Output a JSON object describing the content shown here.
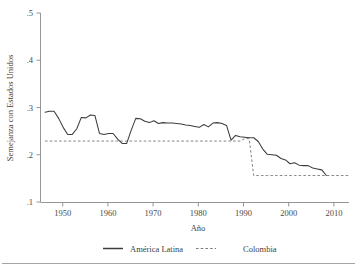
{
  "chart_data": {
    "type": "line",
    "title": "",
    "xlabel": "Año",
    "ylabel": "Semejanza con Estados Unidos",
    "xlim": [
      1945,
      2013
    ],
    "ylim": [
      0.1,
      0.5
    ],
    "grid": false,
    "legend_position": "bottom",
    "xticks": [
      "1950",
      "1960",
      "1970",
      "1980",
      "1990",
      "2000",
      "2010"
    ],
    "xtick_values": [
      1950,
      1960,
      1970,
      1980,
      1990,
      2000,
      2010
    ],
    "yticks": [
      ".1",
      ".2",
      ".3",
      ".4",
      ".5"
    ],
    "ytick_values": [
      0.1,
      0.2,
      0.3,
      0.4,
      0.5
    ],
    "x": [
      1946,
      1947,
      1948,
      1949,
      1950,
      1951,
      1952,
      1953,
      1954,
      1955,
      1956,
      1957,
      1958,
      1959,
      1960,
      1961,
      1962,
      1963,
      1964,
      1965,
      1966,
      1967,
      1968,
      1969,
      1970,
      1971,
      1972,
      1973,
      1974,
      1975,
      1976,
      1977,
      1978,
      1979,
      1980,
      1981,
      1982,
      1983,
      1984,
      1985,
      1986,
      1987,
      1988,
      1989,
      1990,
      1991,
      1992,
      1993,
      1994,
      1995,
      1996,
      1997,
      1998,
      1999,
      2000,
      2001,
      2002,
      2003,
      2004,
      2005,
      2006,
      2007,
      2008
    ],
    "series": [
      {
        "name": "América Latina",
        "style": "solid",
        "color": "#3c3c3c",
        "values": [
          0.29,
          0.292,
          0.292,
          0.277,
          0.258,
          0.243,
          0.243,
          0.255,
          0.279,
          0.278,
          0.284,
          0.283,
          0.245,
          0.243,
          0.245,
          0.245,
          0.233,
          0.224,
          0.224,
          0.252,
          0.277,
          0.276,
          0.271,
          0.268,
          0.272,
          0.266,
          0.268,
          0.267,
          0.267,
          0.266,
          0.265,
          0.263,
          0.262,
          0.26,
          0.258,
          0.264,
          0.259,
          0.267,
          0.268,
          0.266,
          0.262,
          0.231,
          0.241,
          0.238,
          0.237,
          0.236,
          0.236,
          0.228,
          0.212,
          0.201,
          0.2,
          0.199,
          0.192,
          0.189,
          0.181,
          0.183,
          0.178,
          0.177,
          0.177,
          0.172,
          0.17,
          0.168,
          0.156
        ]
      },
      {
        "name": "Colombia",
        "style": "dashed",
        "color": "#7d7d7d",
        "values": [
          0.229,
          0.229,
          0.229,
          0.229,
          0.229,
          0.229,
          0.229,
          0.229,
          0.229,
          0.229,
          0.229,
          0.229,
          0.229,
          0.229,
          0.229,
          0.229,
          0.229,
          0.229,
          0.229,
          0.229,
          0.229,
          0.229,
          0.229,
          0.229,
          0.229,
          0.229,
          0.229,
          0.229,
          0.229,
          0.229,
          0.229,
          0.229,
          0.229,
          0.229,
          0.229,
          0.229,
          0.229,
          0.229,
          0.229,
          0.229,
          0.229,
          0.229,
          0.229,
          0.229,
          0.234,
          0.234,
          0.156,
          0.156,
          0.156,
          0.156,
          0.156,
          0.156,
          0.156,
          0.156,
          0.156,
          0.156,
          0.156,
          0.156,
          0.156,
          0.156,
          0.156,
          0.156,
          0.156
        ]
      }
    ],
    "colombia_extends_to": 2013,
    "annotations": []
  },
  "legend": {
    "items": [
      {
        "label": "América Latina",
        "style": "solid"
      },
      {
        "label": "Colombia",
        "style": "dashed"
      }
    ]
  }
}
